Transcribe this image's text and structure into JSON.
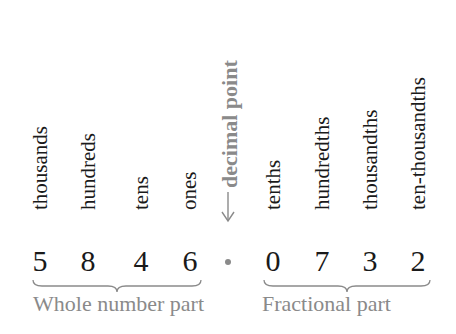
{
  "place_values": {
    "whole": [
      {
        "label": "thousands",
        "digit": "5"
      },
      {
        "label": "hundreds",
        "digit": "8"
      },
      {
        "label": "tens",
        "digit": "4"
      },
      {
        "label": "ones",
        "digit": "6"
      }
    ],
    "decimal_point_label": "decimal point",
    "fractional": [
      {
        "label": "tenths",
        "digit": "0"
      },
      {
        "label": "hundredths",
        "digit": "7"
      },
      {
        "label": "thousandths",
        "digit": "3"
      },
      {
        "label": "ten-thousandths",
        "digit": "2"
      }
    ]
  },
  "parts": {
    "whole_label": "Whole number part",
    "fractional_label": "Fractional part"
  },
  "colors": {
    "text": "#1a1a1a",
    "accent_gray": "#8a8a8a"
  }
}
